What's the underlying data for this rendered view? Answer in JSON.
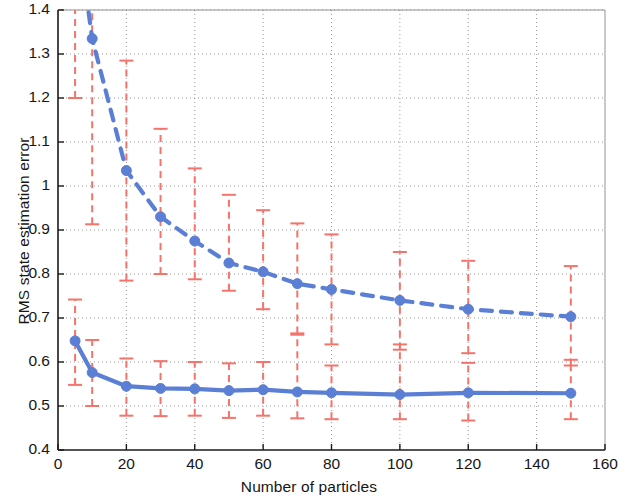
{
  "chart_data": {
    "type": "line",
    "title": "",
    "xlabel": "Number of particles",
    "ylabel": "RMS state estimation error",
    "xlim": [
      0,
      160
    ],
    "ylim": [
      0.4,
      1.4
    ],
    "xticks": [
      0,
      20,
      40,
      60,
      80,
      100,
      120,
      140,
      160
    ],
    "xtick_labels": [
      "0",
      "20",
      "40",
      "60",
      "80",
      "100",
      "120",
      "140",
      "160"
    ],
    "yticks": [
      0.4,
      0.5,
      0.6,
      0.7,
      0.8,
      0.9,
      1.0,
      1.1,
      1.2,
      1.3,
      1.4
    ],
    "ytick_labels": [
      "0.4",
      "0.5",
      "0.6",
      "0.7",
      "0.8",
      "0.9",
      "1",
      "1.1",
      "1.2",
      "1.3",
      "1.4"
    ],
    "grid": true,
    "grid_style": "dotted",
    "legend": null,
    "x": [
      5,
      10,
      20,
      30,
      40,
      50,
      60,
      70,
      80,
      100,
      120,
      150
    ],
    "series": [
      {
        "name": "upper-dashed-series",
        "style": "dashed",
        "marker": "circle",
        "color": "#5B7FD4",
        "errorbar_color": "#F4736B",
        "values": [
          1.62,
          1.335,
          1.035,
          0.93,
          0.875,
          0.825,
          0.805,
          0.778,
          0.765,
          0.74,
          0.72,
          0.703
        ],
        "err_low": [
          1.2,
          0.913,
          0.785,
          0.8,
          0.788,
          0.762,
          0.72,
          0.665,
          0.64,
          0.628,
          0.62,
          0.592
        ],
        "err_high": [
          2.05,
          1.83,
          1.285,
          1.13,
          1.04,
          0.98,
          0.945,
          0.915,
          0.89,
          0.85,
          0.83,
          0.818
        ]
      },
      {
        "name": "lower-solid-series",
        "style": "solid",
        "marker": "circle",
        "color": "#5B7FD4",
        "errorbar_color": "#F4736B",
        "values": [
          0.648,
          0.576,
          0.545,
          0.54,
          0.539,
          0.535,
          0.537,
          0.532,
          0.53,
          0.526,
          0.53,
          0.529
        ],
        "err_low": [
          0.548,
          0.5,
          0.478,
          0.477,
          0.478,
          0.473,
          0.478,
          0.472,
          0.47,
          0.47,
          0.467,
          0.47
        ],
        "err_high": [
          0.742,
          0.65,
          0.608,
          0.602,
          0.6,
          0.597,
          0.6,
          0.662,
          0.592,
          0.64,
          0.598,
          0.605
        ]
      }
    ],
    "colors": {
      "line": "#5B7FD4",
      "errorbar": "#F4736B",
      "axis": "#1a1a1a",
      "grid": "#9a9a9a",
      "background": "#ffffff"
    }
  },
  "axis": {
    "x_label": "Number of particles",
    "y_label": "RMS state estimation error"
  }
}
